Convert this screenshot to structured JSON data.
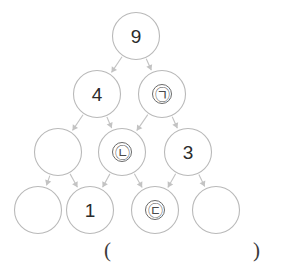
{
  "diagram": {
    "type": "lattice-dag",
    "levels": 4,
    "node_radius": 23.5,
    "colors": {
      "node_stroke": "#b9b9b9",
      "edge_stroke": "#c3c3c3",
      "label": "#2b2b2b",
      "background": "#ffffff"
    },
    "nodes": [
      {
        "id": "n0",
        "label": "9",
        "kind": "digit",
        "level": 0,
        "cx": 136,
        "cy": 36
      },
      {
        "id": "n1",
        "label": "4",
        "kind": "digit",
        "level": 1,
        "cx": 97,
        "cy": 94
      },
      {
        "id": "n2",
        "label": "㉠",
        "kind": "hangul",
        "level": 1,
        "cx": 162,
        "cy": 94
      },
      {
        "id": "n3",
        "label": "",
        "kind": "blank",
        "level": 2,
        "cx": 58,
        "cy": 152
      },
      {
        "id": "n4",
        "label": "㉡",
        "kind": "hangul",
        "level": 2,
        "cx": 122,
        "cy": 152
      },
      {
        "id": "n5",
        "label": "3",
        "kind": "digit",
        "level": 2,
        "cx": 188,
        "cy": 152
      },
      {
        "id": "n6",
        "label": "",
        "kind": "blank",
        "level": 3,
        "cx": 38,
        "cy": 210
      },
      {
        "id": "n7",
        "label": "1",
        "kind": "digit",
        "level": 3,
        "cx": 90,
        "cy": 210
      },
      {
        "id": "n8",
        "label": "㉢",
        "kind": "hangul",
        "level": 3,
        "cx": 155,
        "cy": 210
      },
      {
        "id": "n9",
        "label": "",
        "kind": "blank",
        "level": 3,
        "cx": 216,
        "cy": 210
      }
    ],
    "edges": [
      {
        "from": "n0",
        "to": "n1"
      },
      {
        "from": "n0",
        "to": "n2"
      },
      {
        "from": "n1",
        "to": "n3"
      },
      {
        "from": "n1",
        "to": "n4"
      },
      {
        "from": "n2",
        "to": "n4"
      },
      {
        "from": "n2",
        "to": "n5"
      },
      {
        "from": "n3",
        "to": "n6"
      },
      {
        "from": "n3",
        "to": "n7"
      },
      {
        "from": "n4",
        "to": "n7"
      },
      {
        "from": "n4",
        "to": "n8"
      },
      {
        "from": "n5",
        "to": "n8"
      },
      {
        "from": "n5",
        "to": "n9"
      }
    ]
  },
  "answer": {
    "paren_open": "(",
    "paren_close": ")",
    "value": ""
  }
}
